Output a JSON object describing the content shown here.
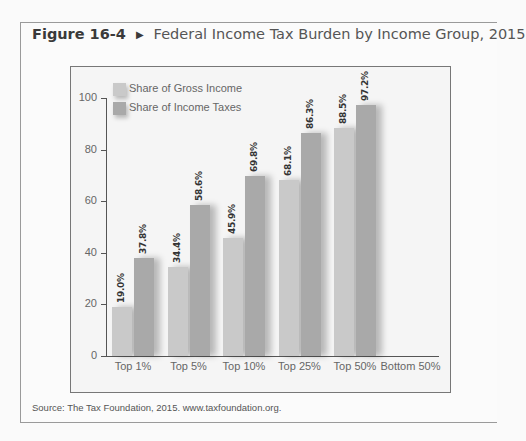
{
  "figure": {
    "number": "Figure 16-4",
    "title": "Federal Income Tax Burden by Income Group, 2015",
    "source": "Source: The Tax Foundation, 2015. www.taxfoundation.org."
  },
  "chart_data": {
    "type": "bar",
    "title": "Federal Income Tax Burden by Income Group, 2015",
    "categories": [
      "Top 1%",
      "Top 5%",
      "Top 10%",
      "Top 25%",
      "Top 50%",
      "Bottom 50%"
    ],
    "series": [
      {
        "name": "Share of Gross Income",
        "values": [
          19.0,
          34.4,
          45.9,
          68.1,
          88.5,
          null
        ],
        "labels": [
          "19.0%",
          "34.4%",
          "45.9%",
          "68.1%",
          "88.5%",
          ""
        ],
        "color": "#c9c9c9"
      },
      {
        "name": "Share of Income Taxes",
        "values": [
          37.8,
          58.6,
          69.8,
          86.3,
          97.2,
          null
        ],
        "labels": [
          "37.8%",
          "58.6%",
          "69.8%",
          "86.3%",
          "97.2%",
          ""
        ],
        "color": "#a9a9a9"
      }
    ],
    "xlabel": "",
    "ylabel": "",
    "ylim": [
      0,
      100
    ],
    "yticks": [
      0,
      20,
      40,
      60,
      80,
      100
    ],
    "grid": false,
    "legend_position": "top-left"
  }
}
